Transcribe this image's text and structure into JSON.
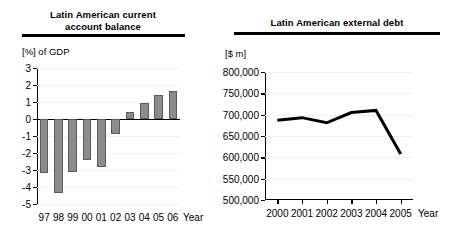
{
  "chart_data": [
    {
      "type": "bar",
      "title": "Latin American current account balance",
      "title_lines": [
        "Latin American current",
        "account balance"
      ],
      "ylabel": "[%] of GDP",
      "xlabel": "Year",
      "categories": [
        "97",
        "98",
        "99",
        "00",
        "01",
        "02",
        "03",
        "04",
        "05",
        "06"
      ],
      "values": [
        -3.2,
        -4.35,
        -3.1,
        -2.4,
        -2.8,
        -0.9,
        0.4,
        0.95,
        1.4,
        1.65
      ],
      "ylim": [
        -5,
        3
      ],
      "yticks": [
        3,
        2,
        1,
        0,
        -1,
        -2,
        -3,
        -4,
        -5
      ],
      "ytick_labels": [
        "3",
        "2",
        "1",
        "0",
        "-1",
        "-2",
        "-3",
        "-4",
        "-5"
      ],
      "grid": true,
      "legend": "none",
      "bar_color": "#8c8c8c",
      "bar_edge_color": "#5a5a5a"
    },
    {
      "type": "line",
      "title": "Latin American external debt",
      "title_lines": [
        "Latin American external debt"
      ],
      "ylabel": "[$ m]",
      "xlabel": "Year",
      "categories": [
        "2000",
        "2001",
        "2002",
        "2003",
        "2004",
        "2005"
      ],
      "values": [
        687000,
        693000,
        681000,
        705000,
        710000,
        608000
      ],
      "ylim": [
        500000,
        800000
      ],
      "yticks": [
        800000,
        750000,
        700000,
        650000,
        600000,
        550000,
        500000
      ],
      "ytick_labels": [
        "800,000",
        "750,000",
        "700,000",
        "650,000",
        "600,000",
        "550,000",
        "500,000"
      ],
      "grid": true,
      "legend": "none",
      "line_color": "#000000",
      "line_width": 3
    }
  ]
}
